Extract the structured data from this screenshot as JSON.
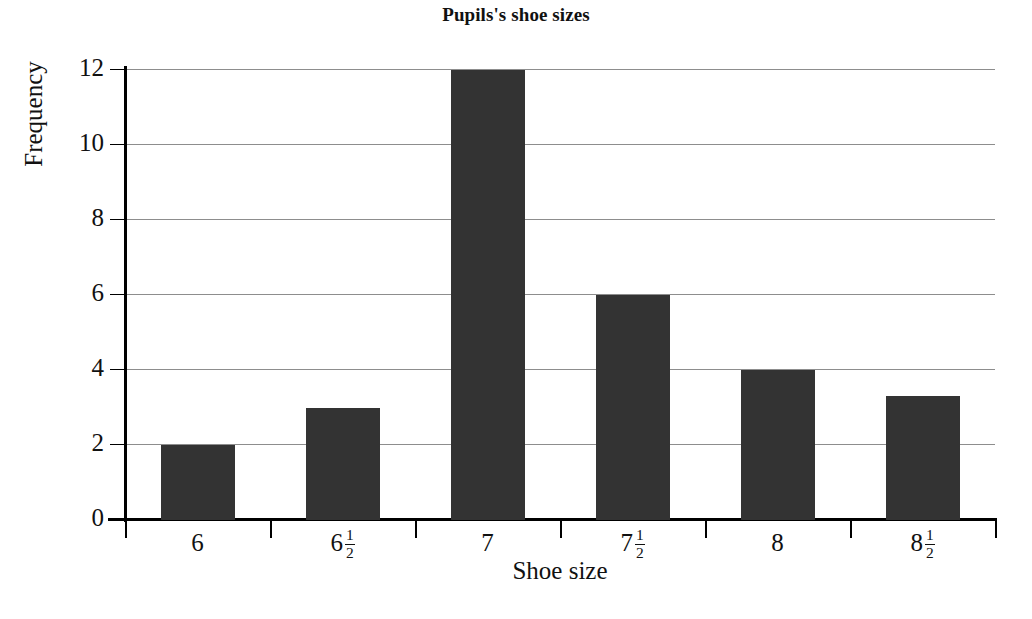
{
  "chart_data": {
    "type": "bar",
    "title": "Pupils's shoe sizes",
    "xlabel": "Shoe size",
    "ylabel": "Frequency",
    "categories": [
      "6",
      "6 1/2",
      "7",
      "7 1/2",
      "8",
      "8 1/2"
    ],
    "category_labels": [
      {
        "whole": "6",
        "numerator": "",
        "denominator": ""
      },
      {
        "whole": "6",
        "numerator": "1",
        "denominator": "2"
      },
      {
        "whole": "7",
        "numerator": "",
        "denominator": ""
      },
      {
        "whole": "7",
        "numerator": "1",
        "denominator": "2"
      },
      {
        "whole": "8",
        "numerator": "",
        "denominator": ""
      },
      {
        "whole": "8",
        "numerator": "1",
        "denominator": "2"
      }
    ],
    "values": [
      2,
      3,
      12,
      6,
      4,
      3.3
    ],
    "ylim": [
      0,
      12
    ],
    "yticks": [
      0,
      2,
      4,
      6,
      8,
      10,
      12
    ],
    "ytick_labels": [
      "0",
      "2",
      "4",
      "6",
      "8",
      "10",
      "12"
    ],
    "grid": true,
    "legend": false,
    "bar_color": "#333333",
    "gridline_color": "#8d8d8d",
    "axis_color": "#000000",
    "background_color": "#ffffff"
  }
}
